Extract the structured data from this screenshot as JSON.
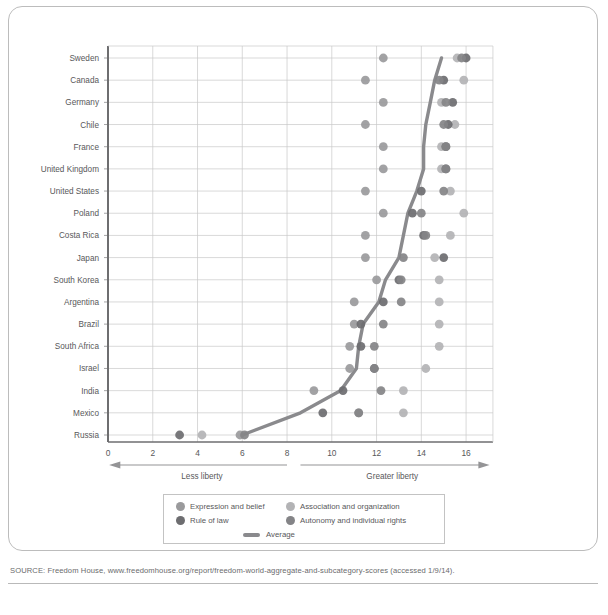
{
  "source": {
    "text": "SOURCE: Freedom House, www.freedomhouse.org/report/freedom-world-aggregate-and-subcategory-scores (accessed 1/9/14)."
  },
  "axis": {
    "x_ticks": [
      "0",
      "2",
      "4",
      "6",
      "8",
      "10",
      "12",
      "14",
      "16"
    ],
    "left_arrow_label": "Less liberty",
    "right_arrow_label": "Greater liberty"
  },
  "legend": {
    "items": [
      {
        "label": "Expression and belief",
        "color": "#9a9a9c",
        "type": "dot"
      },
      {
        "label": "Association and organization",
        "color": "#b3b3b5",
        "type": "dot"
      },
      {
        "label": "Rule of law",
        "color": "#6d6d70",
        "type": "dot"
      },
      {
        "label": "Autonomy and individual rights",
        "color": "#848487",
        "type": "dot"
      },
      {
        "label": "Average",
        "color": "#8a8a8d",
        "type": "line"
      }
    ]
  },
  "chart_data": {
    "type": "scatter",
    "title": "",
    "xlabel": "",
    "ylabel": "",
    "xlim": [
      0,
      17
    ],
    "ylim_categories": true,
    "grid": true,
    "legend_position": "bottom",
    "categories": [
      "Sweden",
      "Canada",
      "Germany",
      "Chile",
      "France",
      "United Kingdom",
      "United States",
      "Poland",
      "Costa Rica",
      "Japan",
      "South Korea",
      "Argentina",
      "Brazil",
      "South Africa",
      "Israel",
      "India",
      "Mexico",
      "Russia"
    ],
    "series": [
      {
        "name": "Expression and belief",
        "color": "#9a9a9c",
        "values": [
          12.3,
          11.5,
          12.3,
          11.5,
          12.3,
          12.3,
          11.5,
          12.3,
          11.5,
          11.5,
          12.0,
          11.0,
          11.0,
          10.8,
          10.8,
          9.2,
          11.2,
          5.9
        ]
      },
      {
        "name": "Association and organization",
        "color": "#b3b3b5",
        "values": [
          15.6,
          15.9,
          14.9,
          15.5,
          14.9,
          14.9,
          15.3,
          15.9,
          15.3,
          14.6,
          14.8,
          14.8,
          14.8,
          14.8,
          14.2,
          13.2,
          13.2,
          4.2
        ]
      },
      {
        "name": "Rule of law",
        "color": "#6d6d70",
        "values": [
          16.0,
          15.0,
          15.4,
          15.2,
          15.1,
          15.1,
          14.0,
          13.6,
          14.1,
          15.0,
          13.0,
          12.3,
          11.3,
          11.3,
          11.9,
          10.5,
          9.6,
          3.2
        ]
      },
      {
        "name": "Autonomy and individual rights",
        "color": "#848487",
        "values": [
          15.8,
          14.8,
          15.1,
          15.0,
          15.1,
          15.1,
          15.0,
          14.0,
          14.2,
          13.2,
          13.1,
          13.1,
          12.3,
          11.9,
          11.9,
          12.2,
          11.2,
          6.1
        ]
      },
      {
        "name": "Average",
        "color": "#8a8a8d",
        "type": "line",
        "values": [
          14.9,
          14.6,
          14.4,
          14.2,
          14.1,
          14.1,
          13.8,
          13.4,
          13.2,
          13.0,
          12.4,
          12.1,
          11.4,
          11.2,
          11.1,
          10.4,
          8.6,
          6.0
        ]
      }
    ]
  }
}
